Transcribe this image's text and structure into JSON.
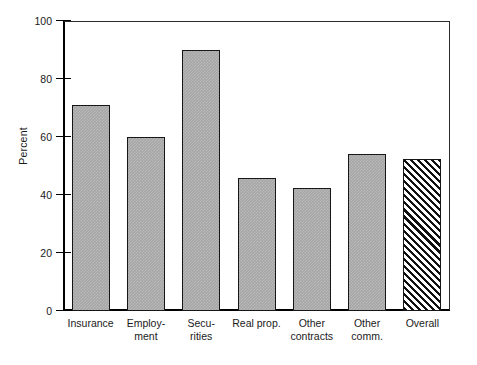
{
  "chart_data": {
    "type": "bar",
    "title": "",
    "xlabel": "",
    "ylabel": "Percent",
    "ylim": [
      0,
      100
    ],
    "yticks": [
      0,
      20,
      40,
      60,
      80,
      100
    ],
    "grid": false,
    "legend": null,
    "categories": [
      "Insurance",
      "Employment",
      "Securities",
      "Real prop.",
      "Other contracts",
      "Other comm.",
      "Overall"
    ],
    "category_lines": [
      [
        "Insurance",
        ""
      ],
      [
        "Employ-",
        "ment"
      ],
      [
        "Secu-",
        "rities"
      ],
      [
        "Real prop.",
        ""
      ],
      [
        "Other",
        "contracts"
      ],
      [
        "Other",
        "comm."
      ],
      [
        "Overall",
        ""
      ]
    ],
    "values": [
      71,
      60,
      90,
      46,
      42.5,
      54,
      52.5
    ],
    "bar_styles": [
      "solid",
      "solid",
      "solid",
      "solid",
      "solid",
      "solid",
      "hatched"
    ],
    "colors": {
      "bar_fill": "#a6a6a6",
      "bar_outline": "#161616",
      "hatch_line": "#111111",
      "axis": "#000000",
      "frame": "#2b2b2b",
      "background": "#ffffff",
      "text": "#1a1a1a"
    }
  }
}
